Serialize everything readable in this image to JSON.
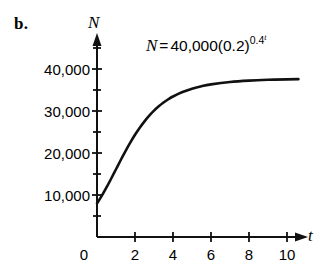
{
  "figure": {
    "part_label": "b.",
    "equation": {
      "lhs": "N",
      "eq_sign": "=",
      "coefficient": "40,000",
      "base": "(0.2)",
      "exponent_base": "0.4",
      "exponent_exponent": "t",
      "plain": "N = 40,000(0.2)^(0.4^t)"
    }
  },
  "chart_data": {
    "type": "line",
    "xlabel": "t",
    "ylabel": "N",
    "xlim": [
      0,
      11
    ],
    "ylim": [
      0,
      45000
    ],
    "grid": false,
    "legend": null,
    "x_ticks": [
      0,
      2,
      4,
      6,
      8,
      10
    ],
    "x_tick_labels": [
      "0",
      "2",
      "4",
      "6",
      "8",
      "10"
    ],
    "y_ticks": [
      10000,
      20000,
      30000,
      40000
    ],
    "y_tick_labels": [
      "10,000",
      "20,000",
      "30,000",
      "40,000"
    ],
    "y_minor_ticks": [
      5000,
      15000,
      25000,
      35000,
      45000
    ],
    "series": [
      {
        "name": "N = 40,000(0.2)^(0.4^t)",
        "color": "#111111",
        "x": [
          0,
          0.25,
          0.5,
          0.75,
          1,
          1.25,
          1.5,
          1.75,
          2,
          2.25,
          2.5,
          2.75,
          3,
          3.25,
          3.5,
          3.75,
          4,
          4.5,
          5,
          5.5,
          6,
          7,
          8,
          9,
          10,
          10.6
        ],
        "values": [
          8000,
          9790,
          11790,
          13930,
          16130,
          18330,
          20460,
          22470,
          24330,
          26020,
          27540,
          28890,
          30080,
          31110,
          32010,
          32790,
          33460,
          34530,
          35320,
          35910,
          36340,
          36910,
          37240,
          37430,
          37540,
          37580
        ]
      }
    ],
    "annotations": [
      {
        "text": "N = 40,000(0.2)^(0.4^t)",
        "x": 4.2,
        "y": 43500
      }
    ]
  }
}
